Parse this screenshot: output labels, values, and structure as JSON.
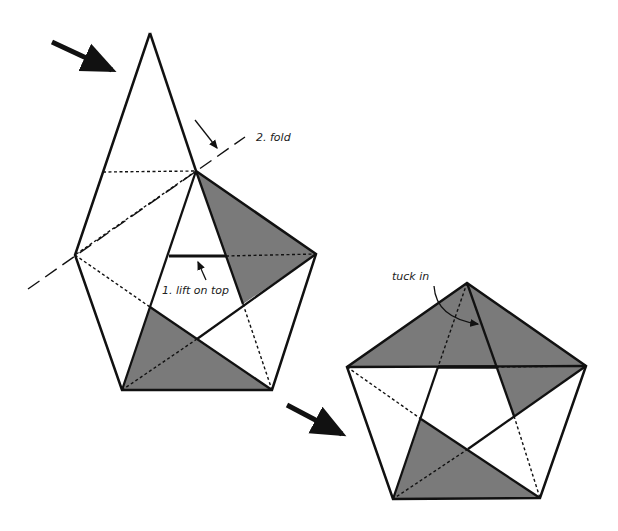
{
  "diagram": {
    "shade_color": "#7a7a7a",
    "line_color": "#111111",
    "labels": {
      "fold": "2.  fold",
      "lift": "1.  lift on top",
      "tuck": "tuck in"
    },
    "steps": [
      {
        "id": "step-1",
        "description": "Kite-shaped folded paper with shaded star triangles"
      },
      {
        "id": "step-2",
        "description": "Completed pentagon with star pattern"
      }
    ]
  }
}
